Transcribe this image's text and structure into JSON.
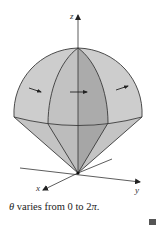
{
  "figure": {
    "axes": {
      "z_label": "z",
      "x_label": "x",
      "y_label": "y"
    },
    "colors": {
      "surface_light": "#cfcfcf",
      "surface_mid": "#bdbdbd",
      "surface_dark": "#a9a9a9",
      "edge": "#3a3a3a",
      "axis": "#333333"
    },
    "arrows": [
      {
        "name": "left-rotation-arrow"
      },
      {
        "name": "center-rotation-arrow"
      },
      {
        "name": "right-rotation-arrow"
      }
    ]
  },
  "caption": {
    "symbol": "θ",
    "text": " varies from 0 to 2",
    "pi": "π",
    "end": "."
  }
}
